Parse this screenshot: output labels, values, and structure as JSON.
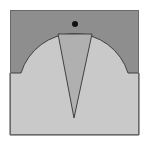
{
  "diagram": {
    "type": "geometric-figure",
    "colors": {
      "background": "#ffffff",
      "upper_region": "#8e8e8e",
      "lower_region": "#c9c9c9",
      "triangle_fill": "#b0b0b0",
      "stroke": "#404040",
      "dot": "#111111"
    },
    "square": {
      "x": 10,
      "y": 10,
      "width": 129,
      "height": 125
    },
    "boundary": {
      "left_flat": {
        "x1": 10,
        "x2": 21,
        "y": 73
      },
      "arc": {
        "x1": 21,
        "x2": 128,
        "y": 73,
        "radius": 56
      },
      "right_flat": {
        "x1": 128,
        "x2": 139,
        "y": 73
      }
    },
    "triangle": {
      "points": [
        [
          58,
          34
        ],
        [
          92,
          34
        ],
        [
          74,
          118
        ]
      ]
    },
    "dot": {
      "cx": 75,
      "cy": 24,
      "r": 3
    }
  }
}
